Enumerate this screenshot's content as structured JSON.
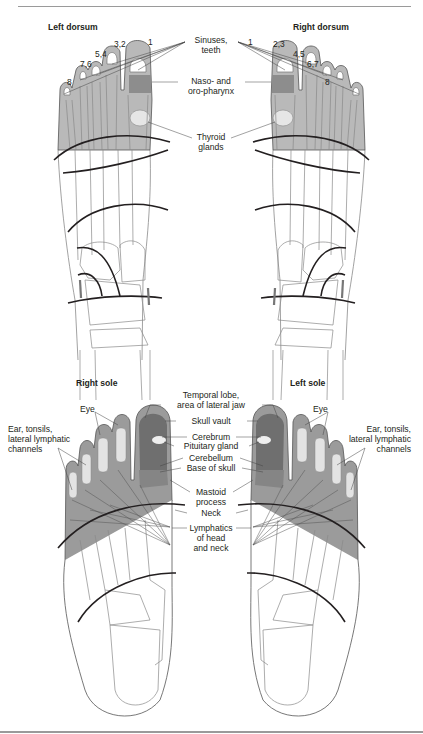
{
  "header": {
    "text": "TREATMENT SEQUENCE   99"
  },
  "top": {
    "left_title": "Left dorsum",
    "right_title": "Right dorsum",
    "left_toe_numbers": [
      "8",
      "7,6",
      "5,4",
      "3,2",
      "1"
    ],
    "right_toe_numbers": [
      "1",
      "2,3",
      "4,5",
      "6,7",
      "8"
    ],
    "labels": {
      "sinuses": [
        "Sinuses,",
        "teeth"
      ],
      "pharynx": [
        "Naso- and",
        "oro-pharynx"
      ],
      "thyroid": [
        "Thyroid",
        "glands"
      ]
    }
  },
  "bottom": {
    "left_title": "Right sole",
    "right_title": "Left sole",
    "labels": {
      "temporal": [
        "Temporal lobe,",
        "area of lateral jaw"
      ],
      "skull_vault": "Skull vault",
      "cerebrum": "Cerebrum",
      "pituitary": "Pituitary gland",
      "cerebellum": "Cerebellum",
      "base_skull": "Base of skull",
      "mastoid": [
        "Mastoid",
        "process"
      ],
      "neck": "Neck",
      "lymphatics": [
        "Lymphatics",
        "of head",
        "and neck"
      ],
      "eye_left": "Eye",
      "eye_right": "Eye",
      "ear_left": [
        "Ear, tonsils,",
        "lateral lymphatic",
        "channels"
      ],
      "ear_right": [
        "Ear, tonsils,",
        "lateral lymphatic",
        "channels"
      ]
    }
  },
  "colors": {
    "zone_light": "#b9b9b9",
    "zone_mid": "#9b9b9b",
    "zone_dark": "#7d7d7d",
    "line": "#231f20",
    "bone": "#8a8a8a"
  }
}
